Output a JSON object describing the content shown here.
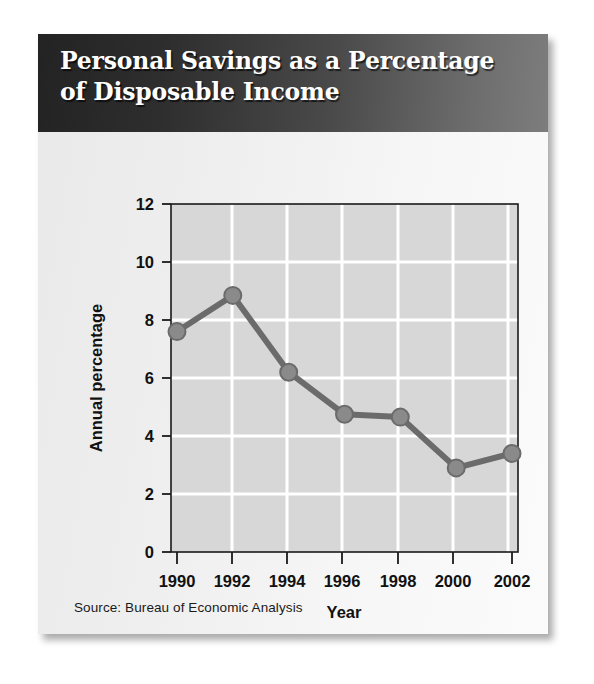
{
  "card": {
    "title": "Personal Savings as a Percentage\nof Disposable Income",
    "source": "Source: Bureau of Economic Analysis"
  },
  "colors": {
    "banner_dark": "#232323",
    "banner_light": "#7d7d7d",
    "plot_background": "#d6d6d6",
    "gridline": "#ffffff",
    "series_line": "#6b6b6b",
    "marker_fill": "#8a8a8a",
    "axis": "#1a1a1a",
    "card_background": "#efefef"
  },
  "chart_data": {
    "type": "line",
    "title": "Personal Savings as a Percentage of Disposable Income",
    "subtitle": "",
    "xlabel": "Year",
    "ylabel": "Annual percentage",
    "x": [
      1990,
      1992,
      1994,
      1996,
      1998,
      2000,
      2002
    ],
    "xtick_labels": [
      "1990",
      "1992",
      "1994",
      "1996",
      "1998",
      "2000",
      "2002"
    ],
    "values": [
      7.6,
      8.85,
      6.2,
      4.75,
      4.65,
      2.9,
      3.4
    ],
    "ytick_labels": [
      "0",
      "2",
      "4",
      "6",
      "8",
      "10",
      "12"
    ],
    "yticks": [
      0,
      2,
      4,
      6,
      8,
      10,
      12
    ],
    "xlim": [
      1989.6,
      2002.4
    ],
    "ylim": [
      0,
      12
    ],
    "grid": true,
    "grid_axis": "y",
    "legend": false,
    "legend_position": "none",
    "annotations": [],
    "series": [
      {
        "name": "Personal savings rate",
        "values": [
          7.6,
          8.85,
          6.2,
          4.75,
          4.65,
          2.9,
          3.4
        ]
      }
    ],
    "source": "Source: Bureau of Economic Analysis"
  }
}
